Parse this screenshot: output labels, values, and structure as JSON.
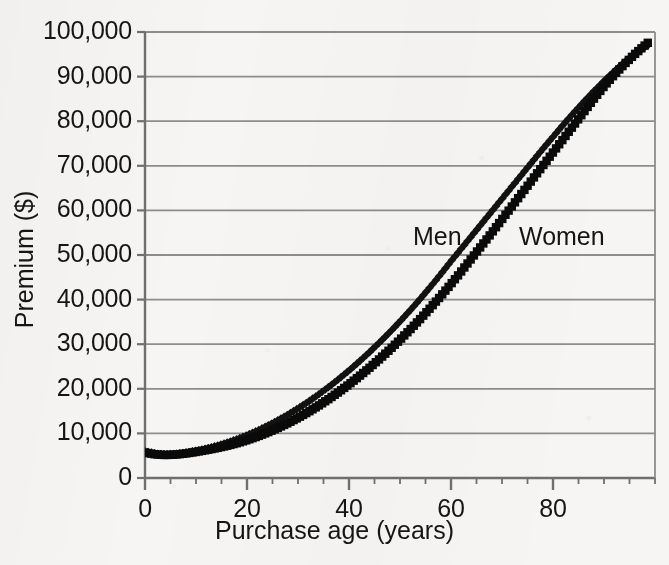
{
  "chart_data": {
    "type": "line",
    "title": "",
    "xlabel": "Purchase age (years)",
    "ylabel": "Premium ($)",
    "xlim": [
      0,
      100
    ],
    "ylim": [
      0,
      100000
    ],
    "grid": "horizontal",
    "legend_position": "inline-annotation",
    "xticks": [
      0,
      20,
      40,
      60,
      80
    ],
    "xtick_labels": [
      "0",
      "20",
      "40",
      "60",
      "80"
    ],
    "yticks": [
      0,
      10000,
      20000,
      30000,
      40000,
      50000,
      60000,
      70000,
      80000,
      90000,
      100000
    ],
    "ytick_labels": [
      "0",
      "10,000",
      "20,000",
      "30,000",
      "40,000",
      "50,000",
      "60,000",
      "70,000",
      "80,000",
      "90,000",
      "100,000"
    ],
    "x": [
      0,
      2,
      4,
      6,
      8,
      10,
      12,
      14,
      16,
      18,
      20,
      22,
      24,
      26,
      28,
      30,
      32,
      34,
      36,
      38,
      40,
      42,
      44,
      46,
      48,
      50,
      52,
      54,
      56,
      58,
      60,
      62,
      64,
      66,
      68,
      70,
      72,
      74,
      76,
      78,
      80,
      82,
      84,
      86,
      88,
      90,
      92,
      94,
      96,
      98,
      99
    ],
    "series": [
      {
        "name": "Men",
        "marker": "diamond",
        "color": "#121212",
        "values": [
          6000,
          5500,
          5300,
          5400,
          5700,
          6100,
          6600,
          7200,
          7900,
          8700,
          9600,
          10600,
          11700,
          12900,
          14200,
          15600,
          17100,
          18700,
          20400,
          22200,
          24100,
          26100,
          28200,
          30400,
          32700,
          35100,
          37600,
          40200,
          42900,
          45700,
          48600,
          51400,
          54200,
          57000,
          59800,
          62600,
          65400,
          68200,
          71000,
          73800,
          76500,
          79200,
          81800,
          84300,
          86700,
          89000,
          91200,
          93200,
          95000,
          96600,
          97300
        ]
      },
      {
        "name": "Women",
        "marker": "square",
        "color": "#0a0a0a",
        "values": [
          5700,
          5300,
          5150,
          5250,
          5500,
          5850,
          6250,
          6700,
          7200,
          7800,
          8500,
          9300,
          10200,
          11200,
          12300,
          13500,
          14800,
          16200,
          17700,
          19300,
          21000,
          22800,
          24700,
          26700,
          28800,
          31000,
          33300,
          35700,
          38200,
          40800,
          43500,
          46300,
          49200,
          52100,
          55000,
          58000,
          61000,
          64000,
          67000,
          70000,
          73000,
          76000,
          79000,
          82000,
          85000,
          87800,
          90400,
          92800,
          95000,
          97000,
          98000
        ]
      }
    ],
    "annotations": [
      {
        "text": "Men",
        "x_px": 413,
        "y_px": 222
      },
      {
        "text": "Women",
        "x_px": 519,
        "y_px": 222
      }
    ]
  },
  "axes": {
    "ytick_labels": [
      "100,000",
      "90,000",
      "80,000",
      "70,000",
      "60,000",
      "50,000",
      "40,000",
      "30,000",
      "20,000",
      "10,000",
      "0"
    ],
    "xtick_labels": [
      "0",
      "20",
      "40",
      "60",
      "80"
    ],
    "xlabel": "Purchase age (years)",
    "ylabel": "Premium ($)"
  },
  "style": {
    "background": "#f6f5f3",
    "gridline_color": "#8d8d8d",
    "axis_color": "#6f6f6f",
    "text_color": "#151515"
  }
}
